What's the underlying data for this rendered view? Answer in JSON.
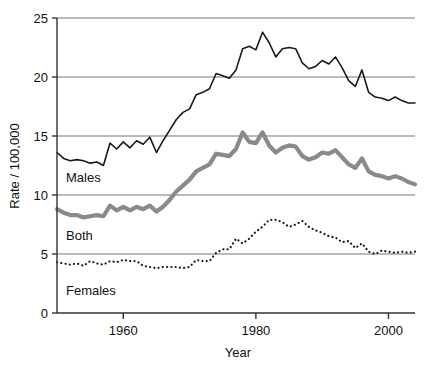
{
  "chart_data": {
    "type": "line",
    "title": "",
    "xlabel": "Year",
    "ylabel": "Rate / 100,000",
    "xlim": [
      1950,
      2004
    ],
    "ylim": [
      0,
      25
    ],
    "xticks": [
      1960,
      1980,
      2000
    ],
    "xtick_labels": [
      "1960",
      "1980",
      "2000"
    ],
    "yticks": [
      0,
      5,
      10,
      15,
      20,
      25
    ],
    "ytick_labels": [
      "0",
      "5",
      "10",
      "15",
      "20",
      "25"
    ],
    "grid": "horizontal",
    "legend_position": "inline-annotations",
    "x": [
      1950,
      1951,
      1952,
      1953,
      1954,
      1955,
      1956,
      1957,
      1958,
      1959,
      1960,
      1961,
      1962,
      1963,
      1964,
      1965,
      1966,
      1967,
      1968,
      1969,
      1970,
      1971,
      1972,
      1973,
      1974,
      1975,
      1976,
      1977,
      1978,
      1979,
      1980,
      1981,
      1982,
      1983,
      1984,
      1985,
      1986,
      1987,
      1988,
      1989,
      1990,
      1991,
      1992,
      1993,
      1994,
      1995,
      1996,
      1997,
      1998,
      1999,
      2000,
      2001,
      2002,
      2003,
      2004
    ],
    "series": [
      {
        "name": "Males",
        "color": "#1a1a1a",
        "style": "solid",
        "width": 1.6,
        "label_text": "Males",
        "values": [
          13.6,
          13.1,
          12.9,
          13.0,
          12.9,
          12.7,
          12.8,
          12.5,
          14.4,
          13.9,
          14.5,
          14.0,
          14.6,
          14.3,
          14.9,
          13.6,
          14.6,
          15.5,
          16.4,
          17.0,
          17.3,
          18.5,
          18.7,
          19.0,
          20.3,
          20.1,
          19.9,
          20.6,
          22.4,
          22.6,
          22.3,
          23.8,
          22.9,
          21.7,
          22.4,
          22.5,
          22.4,
          21.2,
          20.7,
          20.9,
          21.4,
          21.1,
          21.7,
          20.8,
          19.7,
          19.2,
          20.6,
          18.7,
          18.3,
          18.2,
          18.0,
          18.3,
          18.0,
          17.8,
          17.8
        ]
      },
      {
        "name": "Both",
        "color": "#8a8a8a",
        "style": "solid",
        "width": 4.2,
        "label_text": "Both",
        "values": [
          8.8,
          8.5,
          8.3,
          8.3,
          8.1,
          8.2,
          8.3,
          8.2,
          9.1,
          8.7,
          9.0,
          8.7,
          9.0,
          8.8,
          9.1,
          8.6,
          9.0,
          9.6,
          10.3,
          10.8,
          11.3,
          12.0,
          12.3,
          12.6,
          13.5,
          13.4,
          13.3,
          13.9,
          15.3,
          14.5,
          14.4,
          15.3,
          14.2,
          13.6,
          14.0,
          14.2,
          14.1,
          13.3,
          13.0,
          13.2,
          13.6,
          13.5,
          13.8,
          13.2,
          12.6,
          12.3,
          13.1,
          12.0,
          11.7,
          11.6,
          11.4,
          11.6,
          11.4,
          11.1,
          10.9
        ]
      },
      {
        "name": "Females",
        "color": "#1a1a1a",
        "style": "dotted",
        "width": 2.2,
        "label_text": "Females",
        "values": [
          4.3,
          4.2,
          4.1,
          4.2,
          4.0,
          4.4,
          4.2,
          4.1,
          4.4,
          4.3,
          4.5,
          4.4,
          4.4,
          4.0,
          3.9,
          3.8,
          3.9,
          3.9,
          3.9,
          3.8,
          3.9,
          4.5,
          4.4,
          4.4,
          5.1,
          5.4,
          5.4,
          6.3,
          5.9,
          6.3,
          6.9,
          7.3,
          7.9,
          7.9,
          7.7,
          7.3,
          7.5,
          7.8,
          7.3,
          7.0,
          6.8,
          6.5,
          6.4,
          6.0,
          6.1,
          5.5,
          5.9,
          5.2,
          5.0,
          5.3,
          5.2,
          5.1,
          5.2,
          5.1,
          5.2
        ]
      }
    ]
  },
  "labels": {
    "males": "Males",
    "both": "Both",
    "females": "Females"
  },
  "axes": {
    "x_title": "Year",
    "y_title": "Rate / 100,000"
  },
  "colors": {
    "males_line": "#1a1a1a",
    "both_line": "#8a8a8a",
    "females_line": "#1a1a1a",
    "gridline": "#777777",
    "axis": "#333333",
    "background": "#ffffff"
  }
}
